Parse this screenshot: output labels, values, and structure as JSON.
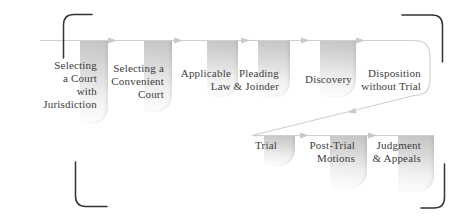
{
  "figure": {
    "type": "flowchart",
    "row1": [
      {
        "id": "selecting-court-jurisdiction",
        "label": "Selecting a Court with Jurisdiction",
        "lines": [
          "Selecting",
          "a Court",
          "with",
          "Jurisdiction"
        ]
      },
      {
        "id": "selecting-convenient-court",
        "label": "Selecting a Convenient Court",
        "lines": [
          "Selecting a",
          "Convenient",
          "Court"
        ]
      },
      {
        "id": "applicable-law",
        "label": "Applicable Law",
        "lines": [
          "Applicable",
          "Law"
        ]
      },
      {
        "id": "pleading-joinder",
        "label": "Pleading & Joinder",
        "lines": [
          "Pleading",
          "& Joinder"
        ]
      },
      {
        "id": "discovery",
        "label": "Discovery",
        "lines": [
          "Discovery"
        ]
      },
      {
        "id": "disposition-without-trial",
        "label": "Disposition without Trial",
        "lines": [
          "Disposition",
          "without Trial"
        ]
      }
    ],
    "row2": [
      {
        "id": "trial",
        "label": "Trial",
        "lines": [
          "Trial"
        ]
      },
      {
        "id": "post-trial-motions",
        "label": "Post-Trial Motions",
        "lines": [
          "Post-Trial",
          "Motions"
        ]
      },
      {
        "id": "judgment-appeals",
        "label": "Judgment & Appeals",
        "lines": [
          "Judgment",
          "& Appeals"
        ]
      }
    ],
    "colors": {
      "background": "#ffffff",
      "connector_line": "#d0d0d0",
      "arrowhead": "#c9c9c9",
      "panel_gradient_top": "#c4c4c4",
      "panel_gradient_bottom": "#fbfbfb",
      "text": "#3d3d3d",
      "corner_bracket": "#333333"
    }
  }
}
